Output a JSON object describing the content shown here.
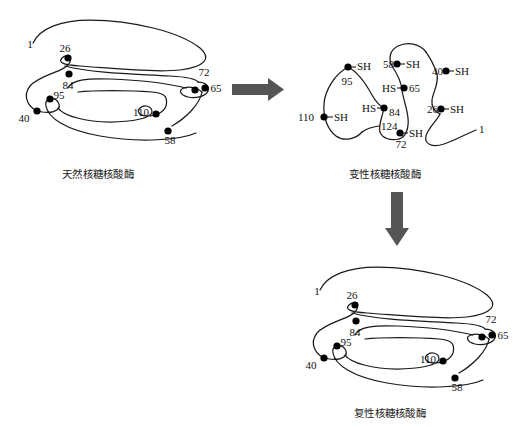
{
  "figure": {
    "background_color": "#ffffff",
    "line_color": "#1a1a1a",
    "node_color": "#000000",
    "arrow_color": "#555555"
  },
  "panels": {
    "native": {
      "caption": "天然核糖核酸酶",
      "terminus_start": "1",
      "residue_labels": [
        "26",
        "84",
        "95",
        "40",
        "110",
        "72",
        "65",
        "58"
      ]
    },
    "denatured": {
      "caption": "变性核糖核酸酶",
      "terminus_start": "1",
      "terminus_end": "124",
      "residues": [
        {
          "number": "95",
          "group": "SH",
          "group_text": "-SH"
        },
        {
          "number": "110",
          "group": "SH",
          "group_text": "-SH"
        },
        {
          "number": "84",
          "group": "HS",
          "group_text": "HS-"
        },
        {
          "number": "72",
          "group": "SH",
          "group_text": "-SH"
        },
        {
          "number": "58",
          "group": "SH",
          "group_text": "-SH"
        },
        {
          "number": "65",
          "group": "HS",
          "group_text": "HS-"
        },
        {
          "number": "40",
          "group": "SH",
          "group_text": "-SH"
        },
        {
          "number": "26",
          "group": "SH",
          "group_text": "-SH"
        }
      ]
    },
    "renatured": {
      "caption": "复性核糖核酸酶",
      "terminus_start": "1",
      "residue_labels": [
        "26",
        "84",
        "95",
        "40",
        "110",
        "72",
        "65",
        "58"
      ]
    }
  },
  "arrows": {
    "horizontal": {
      "name": "denaturation-arrow",
      "direction": "right"
    },
    "vertical": {
      "name": "renaturation-arrow",
      "direction": "down"
    }
  },
  "labels": {
    "sh_text": "SH",
    "hs_text": "HS",
    "n1": "1",
    "n26": "26",
    "n40": "40",
    "n58": "58",
    "n65": "65",
    "n72": "72",
    "n84": "84",
    "n95": "95",
    "n110": "110",
    "n124": "124"
  }
}
